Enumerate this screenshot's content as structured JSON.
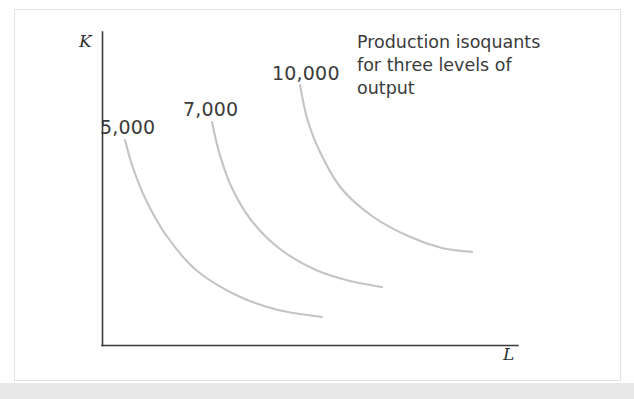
{
  "figure": {
    "background_color": "#ffffff",
    "panel_border_color": "#e2e2e2",
    "bottom_band_color": "#e8e8e8",
    "axis_color": "#3a3a3a",
    "curve_color": "#c4c4c4",
    "text_color": "#3b3b3b"
  },
  "axes": {
    "y_label": "K",
    "x_label": "L"
  },
  "annotation": {
    "lines": [
      "Production isoquants",
      "for three levels of",
      "output"
    ],
    "full_text": "Production isoquants for three levels of output"
  },
  "chart_data": {
    "type": "line",
    "title": "",
    "subtitle": "",
    "xlabel": "L",
    "ylabel": "K",
    "grid": false,
    "legend": "none",
    "annotations": [
      "Production isoquants for three levels of output"
    ],
    "axis_note": "Unlabeled axes; K (capital) on vertical axis, L (labor) on horizontal axis. No tick marks or numeric scale shown.",
    "series": [
      {
        "name": "5,000",
        "label": "5,000",
        "color": "#c4c4c4",
        "points": [
          [
            125,
            140
          ],
          [
            133,
            168
          ],
          [
            146,
            200
          ],
          [
            166,
            235
          ],
          [
            196,
            270
          ],
          [
            236,
            295
          ],
          [
            278,
            310
          ],
          [
            322,
            317
          ]
        ]
      },
      {
        "name": "7,000",
        "label": "7,000",
        "color": "#c4c4c4",
        "points": [
          [
            212,
            122
          ],
          [
            219,
            152
          ],
          [
            231,
            186
          ],
          [
            251,
            220
          ],
          [
            280,
            249
          ],
          [
            316,
            270
          ],
          [
            350,
            281
          ],
          [
            382,
            287
          ]
        ]
      },
      {
        "name": "10,000",
        "label": "10,000",
        "color": "#c4c4c4",
        "points": [
          [
            300,
            85
          ],
          [
            307,
            118
          ],
          [
            320,
            152
          ],
          [
            341,
            188
          ],
          [
            372,
            216
          ],
          [
            408,
            236
          ],
          [
            442,
            248
          ],
          [
            472,
            252
          ]
        ]
      }
    ]
  }
}
